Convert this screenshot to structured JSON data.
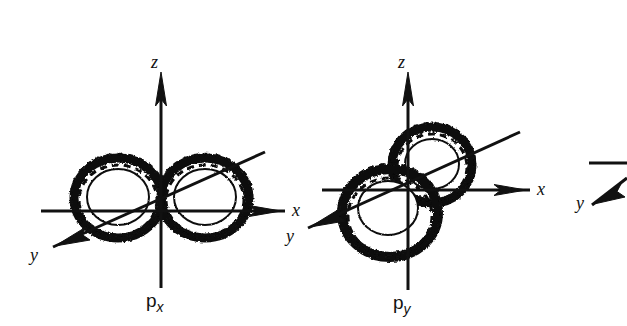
{
  "figure": {
    "background_color": "#ffffff",
    "ink_color": "#111111",
    "width": 627,
    "height": 326,
    "caption_style": "hand-drawn p atomic orbitals with cartesian axes"
  },
  "diagrams": [
    {
      "id": "p-x",
      "label_base": "p",
      "label_sub": "x",
      "label_full": "px",
      "lobe_orientation": "along-x",
      "origin": {
        "x": 161,
        "y": 203
      },
      "axes": [
        {
          "name": "z",
          "label": "z",
          "direction": "up",
          "arrow": true
        },
        {
          "name": "x",
          "label": "x",
          "direction": "right",
          "arrow": true
        },
        {
          "name": "y",
          "label": "y",
          "direction": "down-left",
          "arrow": true
        }
      ]
    },
    {
      "id": "p-y",
      "label_base": "p",
      "label_sub": "y",
      "label_full": "py",
      "lobe_orientation": "along-y",
      "origin": {
        "x": 408,
        "y": 192
      },
      "axes": [
        {
          "name": "z",
          "label": "z",
          "direction": "up",
          "arrow": true
        },
        {
          "name": "x",
          "label": "x",
          "direction": "right",
          "arrow": true
        },
        {
          "name": "y",
          "label": "y",
          "direction": "down-left",
          "arrow": true
        }
      ]
    },
    {
      "id": "p-third-cropped",
      "label_base": "",
      "label_sub": "",
      "label_full": "",
      "lobe_orientation": "cropped",
      "origin": {
        "x": 640,
        "y": 192
      },
      "axes": [
        {
          "name": "y",
          "label": "y",
          "direction": "down-left",
          "arrow": true
        }
      ]
    }
  ],
  "labels": {
    "d1_z": "z",
    "d1_x": "x",
    "d1_y": "y",
    "d1_name_base": "p",
    "d1_name_sub": "x",
    "d2_z": "z",
    "d2_x": "x",
    "d2_y": "y",
    "d2_name_base": "p",
    "d2_name_sub": "y",
    "d3_y": "y"
  }
}
